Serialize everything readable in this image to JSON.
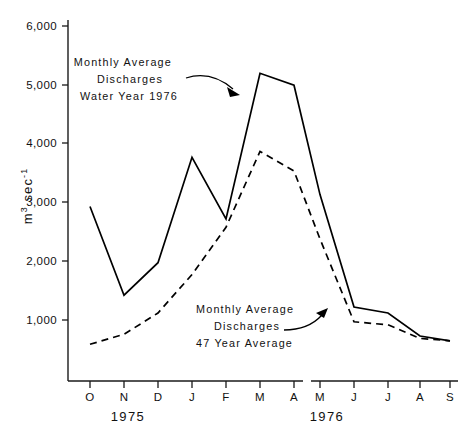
{
  "chart_data": {
    "type": "line",
    "title": "",
    "xlabel": "",
    "ylabel": "m3 sec-1",
    "ylabel_parts": {
      "base1": "m",
      "sup1": "3",
      "base2": " sec",
      "sup2": "-1"
    },
    "categories": [
      "O",
      "N",
      "D",
      "J",
      "F",
      "M",
      "A",
      "M",
      "J",
      "J",
      "A",
      "S"
    ],
    "x_group_labels": [
      "1975",
      "1976"
    ],
    "ytick_labels": [
      "1,000",
      "2,000",
      "3,000",
      "4,000",
      "5,000",
      "6,000"
    ],
    "ytick_values": [
      1000,
      2000,
      3000,
      4000,
      5000,
      6000
    ],
    "ylim": [
      0,
      6000
    ],
    "grid": false,
    "legend_position": "none",
    "series": [
      {
        "name": "Monthly Average Discharges Water Year 1976",
        "style": "solid",
        "values": [
          2950,
          1450,
          2000,
          3780,
          2740,
          5200,
          5000,
          3150,
          1250,
          1150,
          760,
          680
        ]
      },
      {
        "name": "Monthly Average Discharges 47 Year Average",
        "style": "dashed",
        "values": [
          620,
          790,
          1150,
          1800,
          2600,
          3880,
          3550,
          2400,
          1000,
          950,
          720,
          680
        ]
      }
    ],
    "annotations": [
      {
        "id": "annotation-solid",
        "lines": [
          "Monthly  Average",
          "Discharges",
          "Water Year 1976"
        ],
        "target_series": "Monthly Average Discharges Water Year 1976"
      },
      {
        "id": "annotation-dashed",
        "lines": [
          "Monthly  Average",
          "Discharges",
          "47 Year Average"
        ],
        "target_series": "Monthly Average Discharges 47 Year Average"
      }
    ]
  }
}
